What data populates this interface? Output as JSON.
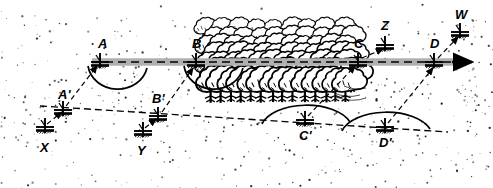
{
  "diagram": {
    "kind": "surveying-traverse-diagram",
    "title_text": "",
    "background_color": "#ffffff",
    "ink_color": "#000000",
    "traverse_band_color": "#b0b0b0",
    "canvas": {
      "width": 493,
      "height": 188
    },
    "main_line": {
      "name": "main-traverse-line",
      "style": "dashed-over-gray-band",
      "arrow_end": "right",
      "x1": 92,
      "y1": 62,
      "x2": 472,
      "y2": 62,
      "band_thickness": 7
    },
    "offset_line": {
      "name": "offset-traverse-line",
      "style": "dashed",
      "x1": 48,
      "y1": 108,
      "x2": 392,
      "y2": 128
    },
    "stations_main": [
      {
        "id": "A",
        "label": "A",
        "x": 100,
        "y": 62,
        "label_x": 98,
        "label_y": 48
      },
      {
        "id": "B",
        "label": "B",
        "x": 196,
        "y": 62,
        "label_x": 192,
        "label_y": 48
      },
      {
        "id": "C",
        "label": "C",
        "x": 358,
        "y": 62,
        "label_x": 354,
        "label_y": 48
      },
      {
        "id": "D",
        "label": "D",
        "x": 434,
        "y": 62,
        "label_x": 430,
        "label_y": 48
      }
    ],
    "stations_offset": [
      {
        "id": "A'",
        "label": "A'",
        "x": 63,
        "y": 110,
        "label_x": 58,
        "label_y": 99
      },
      {
        "id": "B'",
        "label": "B'",
        "x": 158,
        "y": 116,
        "label_x": 152,
        "label_y": 103
      },
      {
        "id": "C'",
        "label": "C'",
        "x": 305,
        "y": 120,
        "label_x": 299,
        "label_y": 140
      },
      {
        "id": "D'",
        "label": "D'",
        "x": 385,
        "y": 127,
        "label_x": 379,
        "label_y": 147
      }
    ],
    "stations_reference": [
      {
        "id": "X",
        "label": "X",
        "x": 45,
        "y": 127,
        "label_x": 40,
        "label_y": 152
      },
      {
        "id": "Y",
        "label": "Y",
        "x": 143,
        "y": 131,
        "label_x": 137,
        "label_y": 155
      },
      {
        "id": "Z",
        "label": "Z",
        "x": 385,
        "y": 45,
        "label_x": 381,
        "label_y": 30
      },
      {
        "id": "W",
        "label": "W",
        "x": 460,
        "y": 32,
        "label_x": 455,
        "label_y": 19
      }
    ],
    "sight_lines": [
      {
        "name": "sight-X-to-Aprime",
        "from": "X",
        "to": "A'"
      },
      {
        "name": "sight-Aprime-to-A",
        "from": "A'",
        "to": "A"
      },
      {
        "name": "sight-Y-to-Bprime",
        "from": "Y",
        "to": "B'"
      },
      {
        "name": "sight-Bprime-to-B",
        "from": "B'",
        "to": "B"
      },
      {
        "name": "sight-Cprime-to-C",
        "from": "C'",
        "to": "C"
      },
      {
        "name": "sight-C-to-Z",
        "from": "C",
        "to": "Z"
      },
      {
        "name": "sight-Dprime-to-D",
        "from": "D'",
        "to": "D"
      },
      {
        "name": "sight-D-to-W",
        "from": "D",
        "to": "W"
      }
    ],
    "arcs": [
      {
        "name": "arc-at-A",
        "cx": 117,
        "cy": 68,
        "rx": 30,
        "ry": 26,
        "orientation": "below"
      },
      {
        "name": "arc-at-B",
        "cx": 213,
        "cy": 68,
        "rx": 30,
        "ry": 26,
        "orientation": "below"
      },
      {
        "name": "arc-at-Cprime",
        "cx": 305,
        "cy": 122,
        "rx": 45,
        "ry": 24,
        "orientation": "above"
      },
      {
        "name": "arc-at-Dprime",
        "cx": 385,
        "cy": 129,
        "rx": 45,
        "ry": 24,
        "orientation": "above"
      }
    ],
    "vegetation": {
      "name": "tree-grove",
      "description_label": "",
      "bounds": {
        "x": 196,
        "y": 22,
        "width": 160,
        "height": 78
      }
    },
    "ground_texture": {
      "name": "stipple-ground-texture",
      "dot_color": "#1a1a1a"
    }
  }
}
